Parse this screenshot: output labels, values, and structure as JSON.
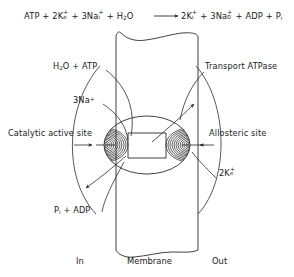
{
  "figure": {
    "title_equation": {
      "full_text": "ATP + 2Ke+ + 3Nai+ + H2O → 2Ki+ + 3Na0+ + ADP + Pi",
      "left": {
        "t1": "ATP",
        "plus1": "+",
        "t2_base": "2K",
        "t2_sub": "e",
        "t2_sup": "+",
        "plus2": "+",
        "t3_base": "3Na",
        "t3_sub": "i",
        "t3_sup": "+",
        "plus3": "+",
        "t4_base": "H",
        "t4_sub": "2",
        "t4_rest": "O"
      },
      "arrow": "→",
      "right": {
        "t1_base": "2K",
        "t1_sub": "i",
        "t1_sup": "+",
        "plus1": "+",
        "t2_base": "3Na",
        "t2_sub": "0",
        "t2_sup": "+",
        "plus2": "+",
        "t3": "ADP",
        "plus3": "+",
        "t4_base": "P",
        "t4_sub": "i"
      }
    },
    "labels": {
      "h2o_atp": {
        "a": "H",
        "sub": "2",
        "b": "O + ATP"
      },
      "na3": {
        "base": "3Na",
        "sup": "+"
      },
      "catalytic_active_site": "Catalytic active site",
      "transport_atpase": "Transport ATPase",
      "allosteric_site": "Allosteric site",
      "k2e": {
        "base": "2K",
        "sub": "e",
        "sup": "+"
      },
      "pi_adp": {
        "base": "P",
        "sub": "i",
        "rest": " + ADP"
      }
    },
    "axis": {
      "in": "In",
      "membrane": "Membrane",
      "out": "Out"
    },
    "colors": {
      "line": "#2b2b2b",
      "text": "#1a1a1a",
      "background": "#ffffff"
    }
  }
}
